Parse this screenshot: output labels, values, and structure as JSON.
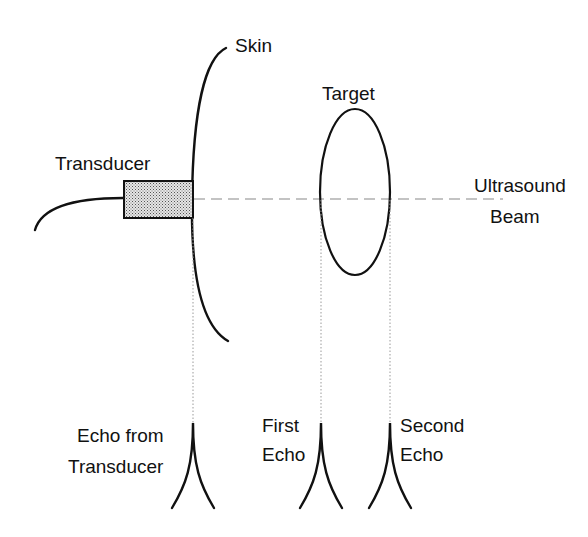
{
  "diagram": {
    "labels": {
      "skin": "Skin",
      "transducer": "Transducer",
      "target": "Target",
      "beam_line1": "Ultrasound",
      "beam_line2": "Beam",
      "echo_transducer_line1": "Echo from",
      "echo_transducer_line2": "Transducer",
      "first_echo_line1": "First",
      "first_echo_line2": "Echo",
      "second_echo_line1": "Second",
      "second_echo_line2": "Echo"
    },
    "colors": {
      "ink": "#111111",
      "beam": "#888888",
      "projection": "#9a9a9a",
      "transducer_fill": "#cfcfcf"
    }
  }
}
